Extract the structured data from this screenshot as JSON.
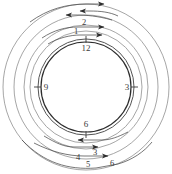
{
  "figure": {
    "type": "concentric-circle-diagram",
    "title": "",
    "background_color": "#ffffff",
    "stroke_color": "#6e6e6e",
    "stroke_color_dark": "#2d2d2d",
    "label_color": "#3a3a3a",
    "center": {
      "x": 86,
      "y": 87
    },
    "circles": [
      {
        "name": "outer-ring-1",
        "r": 83,
        "stroke": "#8a8a8a",
        "width": 0.8
      },
      {
        "name": "outer-ring-2",
        "r": 72,
        "stroke": "#8a8a8a",
        "width": 0.8
      },
      {
        "name": "outer-ring-3",
        "r": 62,
        "stroke": "#8a8a8a",
        "width": 0.8
      },
      {
        "name": "outer-ring-4",
        "r": 56,
        "stroke": "#8a8a8a",
        "width": 0.8
      },
      {
        "name": "inner-ring-outer",
        "r": 48,
        "stroke": "#4a4a4a",
        "width": 1.0
      },
      {
        "name": "inner-ring-inner",
        "r": 45,
        "stroke": "#2d2d2d",
        "width": 1.2
      }
    ],
    "clock_labels": [
      {
        "name": "clock-label-12",
        "text": "12",
        "x": 86,
        "y": 46
      },
      {
        "name": "clock-label-3",
        "text": "3",
        "x": 129,
        "y": 88
      },
      {
        "name": "clock-label-6",
        "text": "6",
        "x": 86,
        "y": 124
      },
      {
        "name": "clock-label-9",
        "text": "9",
        "x": 45,
        "y": 88
      }
    ],
    "tick_marks": [
      {
        "name": "tick-12",
        "x1": 86,
        "y1": 36,
        "x2": 86,
        "y2": 42
      },
      {
        "name": "tick-3",
        "x1": 132,
        "y1": 87,
        "x2": 138,
        "y2": 87
      },
      {
        "name": "tick-6",
        "x1": 86,
        "y1": 132,
        "x2": 86,
        "y2": 138
      },
      {
        "name": "tick-9",
        "x1": 34,
        "y1": 87,
        "x2": 40,
        "y2": 87
      }
    ],
    "callouts": [
      {
        "name": "callout-1",
        "text": "1",
        "tx": 77,
        "ty": 31
      },
      {
        "name": "callout-2",
        "text": "2",
        "tx": 84,
        "ty": 22
      },
      {
        "name": "callout-3",
        "text": "3",
        "tx": 93,
        "ty": 154
      },
      {
        "name": "callout-4",
        "text": "4",
        "tx": 78,
        "ty": 158
      },
      {
        "name": "callout-5",
        "text": "5",
        "tx": 87,
        "ty": 165
      },
      {
        "name": "callout-6",
        "text": "6",
        "tx": 110,
        "ty": 164
      }
    ],
    "arrows": [
      {
        "name": "arrow-top-1-right",
        "direction": "right"
      },
      {
        "name": "arrow-top-2-left",
        "direction": "left"
      },
      {
        "name": "arrow-top-3-left",
        "direction": "left"
      },
      {
        "name": "arrow-top-4-right",
        "direction": "right"
      },
      {
        "name": "arrow-top-5-right",
        "direction": "right"
      },
      {
        "name": "arrow-bottom-1-left",
        "direction": "left"
      },
      {
        "name": "arrow-bottom-2-right",
        "direction": "right"
      },
      {
        "name": "arrow-bottom-3-right",
        "direction": "right"
      }
    ]
  }
}
